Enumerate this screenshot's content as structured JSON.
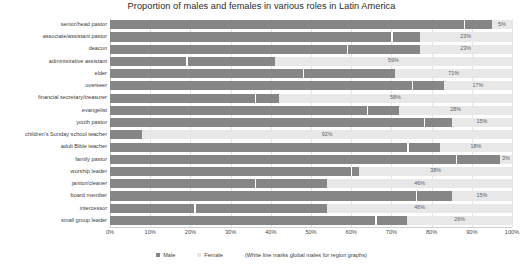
{
  "chart_data": {
    "type": "bar",
    "title": "Proportion of males and females in various roles in Latin America",
    "xlabel": "",
    "ylabel": "",
    "xlim": [
      0,
      100
    ],
    "grid": true,
    "stacked": true,
    "orientation": "horizontal",
    "legend_position": "bottom",
    "tick_labels": [
      "0%",
      "10%",
      "20%",
      "30%",
      "40%",
      "50%",
      "60%",
      "70%",
      "80%",
      "90%",
      "100%"
    ],
    "tick_values": [
      0,
      10,
      20,
      30,
      40,
      50,
      60,
      70,
      80,
      90,
      100
    ],
    "categories": [
      "senior/head pastor",
      "associate/assistant pastor",
      "deacon",
      "administrative assistant",
      "elder",
      "overseer",
      "financial secretary/treasurer",
      "evangelist",
      "youth pastor",
      "children's Sunday school teacher",
      "adult Bible teacher",
      "family pastor",
      "worship leader",
      "janitor/cleaner",
      "board member",
      "intercessor",
      "small group leader"
    ],
    "series": [
      {
        "name": "Male",
        "color": "#868686",
        "values": [
          95,
          77,
          77,
          41,
          71,
          83,
          42,
          72,
          85,
          8,
          82,
          97,
          62,
          54,
          85,
          54,
          74
        ]
      },
      {
        "name": "Female",
        "color": "#e8e8e8",
        "values": [
          5,
          23,
          23,
          59,
          29,
          17,
          58,
          28,
          15,
          92,
          18,
          3,
          38,
          46,
          15,
          46,
          26
        ]
      }
    ],
    "data_labels": [
      "5%",
      "23%",
      "23%",
      "59%",
      "71%",
      "17%",
      "58%",
      "28%",
      "15%",
      "92%",
      "18%",
      "3%",
      "38%",
      "46%",
      "15%",
      "46%",
      "26%"
    ],
    "global_male_marker": {
      "description": "White line marks global males for region graphs",
      "values": [
        88,
        70,
        59,
        19,
        48,
        75,
        36,
        64,
        78,
        8,
        74,
        86,
        60,
        36,
        76,
        21,
        66
      ]
    },
    "annotation": "(White line marks global males for region graphs)"
  },
  "legend": {
    "male_label": "Male",
    "female_label": "Female",
    "note": "(White line marks global males for region graphs)"
  }
}
